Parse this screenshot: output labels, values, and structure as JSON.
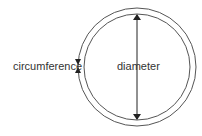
{
  "diagram": {
    "labels": {
      "circumference": "circumference",
      "diameter": "diameter"
    },
    "colors": {
      "stroke": "#333333",
      "text": "#333333",
      "background": "#ffffff"
    },
    "shapes": {
      "outer_circle": {
        "cx": 137,
        "cy": 67,
        "r": 59
      },
      "inner_circle": {
        "cx": 137,
        "cy": 67,
        "r": 53
      }
    }
  }
}
